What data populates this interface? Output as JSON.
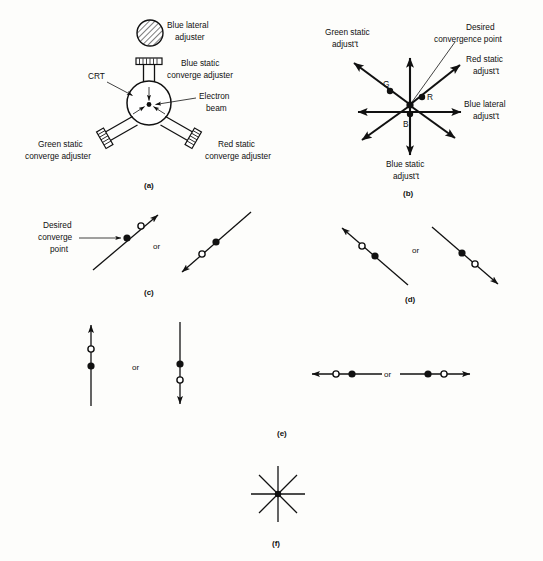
{
  "figure": {
    "background_color": "#fdfdfb",
    "ink_color": "#111111",
    "panel_labels": {
      "a": "(a)",
      "b": "(b)",
      "c": "(c)",
      "d": "(d)",
      "e": "(e)",
      "f": "(f)"
    },
    "connector_word": "or"
  },
  "panel_a": {
    "caption": "(a)",
    "labels": {
      "blue_lateral_adjuster_line1": "Blue lateral",
      "blue_lateral_adjuster_line2": "adjuster",
      "blue_static_line1": "Blue static",
      "blue_static_line2": "converge adjuster",
      "crt": "CRT",
      "electron_beam_line1": "Electron",
      "electron_beam_line2": "beam",
      "green_static_line1": "Green static",
      "green_static_line2": "converge adjuster",
      "red_static_line1": "Red static",
      "red_static_line2": "converge adjuster"
    }
  },
  "panel_b": {
    "caption": "(b)",
    "labels": {
      "green_static_line1": "Green static",
      "green_static_line2": "adjust't",
      "desired_convergence_line1": "Desired",
      "desired_convergence_line2": "convergence point",
      "red_static_line1": "Red static",
      "red_static_line2": "adjust't",
      "blue_lateral_line1": "Blue lateral",
      "blue_lateral_line2": "adjust't",
      "blue_static_line1": "Blue static",
      "blue_static_line2": "adjust't"
    },
    "beam_markers": {
      "green": "G",
      "red": "R",
      "blue": "B"
    }
  },
  "panel_c": {
    "caption": "(c)",
    "labels": {
      "desired_converge_line1": "Desired",
      "desired_converge_line2": "converge",
      "desired_converge_line3": "point"
    },
    "connector": "or"
  },
  "panel_d": {
    "caption": "(d)",
    "connector": "or"
  },
  "panel_e": {
    "caption": "(e)",
    "connector_left": "or",
    "connector_right": "or"
  },
  "panel_f": {
    "caption": "(f)"
  }
}
